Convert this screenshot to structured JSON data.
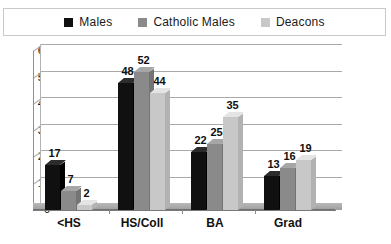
{
  "chart_data": {
    "type": "bar",
    "title": "",
    "subtitle": "",
    "xlabel": "",
    "ylabel": "",
    "ylim": [
      0,
      60
    ],
    "ytick_step": 10,
    "yticks": [
      "60",
      "50",
      "40",
      "30",
      "20",
      "10",
      "0"
    ],
    "grid": true,
    "legend_position": "top",
    "categories": [
      "<HS",
      "HS/Coll",
      "BA",
      "Grad"
    ],
    "series": [
      {
        "name": "Males",
        "color": "#101010",
        "values": [
          17,
          48,
          22,
          13
        ]
      },
      {
        "name": "Catholic Males",
        "color": "#8a8a8a",
        "values": [
          7,
          52,
          25,
          16
        ]
      },
      {
        "name": "Deacons",
        "color": "#c8c8c8",
        "values": [
          2,
          44,
          35,
          19
        ]
      }
    ]
  },
  "legend": {
    "items": [
      {
        "label": "Males",
        "swatch": "#101010"
      },
      {
        "label": "Catholic Males",
        "swatch": "#8a8a8a"
      },
      {
        "label": "Deacons",
        "swatch": "#c8c8c8"
      }
    ]
  },
  "colors": {
    "males": "#101010",
    "catholic_males": "#8a8a8a",
    "deacons": "#c8c8c8",
    "grid": "#a9a9a9",
    "axis": "#7a7a7a",
    "floor": "#a9a9a9",
    "legend_border": "#c9c9c9",
    "text": "#111111"
  }
}
